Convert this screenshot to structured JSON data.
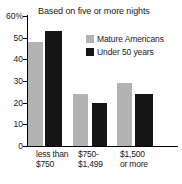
{
  "chart_data": {
    "type": "bar",
    "title": "Based on five or more nights",
    "xlabel": "",
    "ylabel": "",
    "ylim": [
      0,
      60
    ],
    "yticks": [
      0,
      10,
      20,
      30,
      40,
      50,
      60
    ],
    "ytick_labels": [
      "0",
      "10",
      "20",
      "30",
      "40",
      "50",
      "60%"
    ],
    "grid": false,
    "legend_position": "upper right",
    "categories": [
      "less than $750",
      "$750-$1,499",
      "$1,500 or more"
    ],
    "category_lines": [
      {
        "line1": "less than",
        "line2": "$750"
      },
      {
        "line1": "$750-",
        "line2": "$1,499"
      },
      {
        "line1": "$1,500",
        "line2": "or more"
      }
    ],
    "series": [
      {
        "name": "Mature Americans",
        "color": "#b3b3b3",
        "values": [
          48,
          24,
          29
        ]
      },
      {
        "name": "Under 50 years",
        "color": "#151515",
        "values": [
          53,
          20,
          24
        ]
      }
    ]
  },
  "colors": {
    "axis": "#000000",
    "text": "#1a1a1a",
    "background": "#ffffff",
    "series_gray": "#b3b3b3",
    "series_black": "#151515"
  }
}
